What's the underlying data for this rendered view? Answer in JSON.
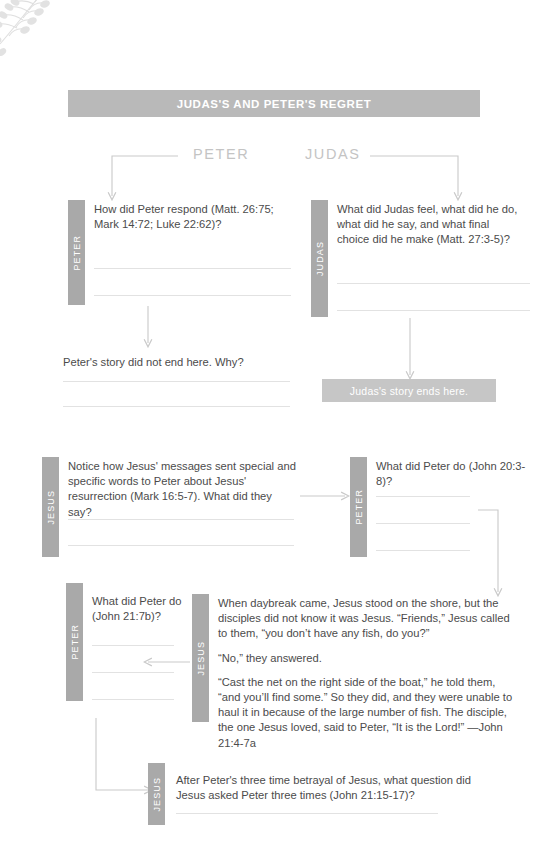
{
  "page": {
    "banner_title": "JUDAS'S AND PETER'S REGRET",
    "decoration": "leafy-vine-branch"
  },
  "columns": {
    "peter_heading": "PETER",
    "judas_heading": "JUDAS"
  },
  "tabs": {
    "peter": "PETER",
    "judas": "JUDAS",
    "jesus": "JESUS"
  },
  "blocks": {
    "peter_q1": {
      "tab": "PETER",
      "text": "How did Peter respond (Matt. 26:75; Mark 14:72; Luke 22:62)?",
      "lines": 2
    },
    "judas_q1": {
      "tab": "JUDAS",
      "text": "What did Judas feel, what did he do, what did he say, and what final choice did he make (Matt. 27:3-5)?",
      "lines": 2
    },
    "peter_q2": {
      "text": "Peter's story did not end here. Why?",
      "lines": 2
    },
    "judas_end": {
      "text": "Judas's story ends here."
    },
    "jesus_q1": {
      "tab": "JESUS",
      "text": "Notice how Jesus' messages sent special and specific words to Peter about Jesus' resurrection (Mark 16:5-7). What did they say?",
      "lines": 2
    },
    "peter_q3": {
      "tab": "PETER",
      "text": "What did Peter do (John 20:3-8)?",
      "lines": 3
    },
    "peter_q4": {
      "tab": "PETER",
      "text": "What did Peter do (John 21:7b)?",
      "lines": 3
    },
    "jesus_scripture": {
      "tab": "JESUS",
      "paragraphs": [
        "When daybreak came, Jesus stood on the shore, but the disciples did not know it was Jesus. “Friends,” Jesus called to them, “you don’t have any fish, do you?”",
        "“No,” they answered.",
        "“Cast the net on the right side of the boat,” he told them, “and you’ll find some.” So they did, and they were unable to haul it in because of the large number of fish. The disciple, the one Jesus loved, said to Peter, “It is the Lord!” —John 21:4-7a"
      ]
    },
    "jesus_q2": {
      "tab": "JESUS",
      "text": "After Peter's three time betrayal of Jesus, what question did Jesus asked Peter three times (John 21:15-17)?",
      "lines": 1
    }
  },
  "colors": {
    "banner": "#b9b9b9",
    "tab": "#a9a9a9",
    "end_bar": "#c6c6c6",
    "rule": "#e2e2e2",
    "connector": "#c9c9c9",
    "heading": "#c4c4c4",
    "body_text": "#4b4b4b"
  }
}
